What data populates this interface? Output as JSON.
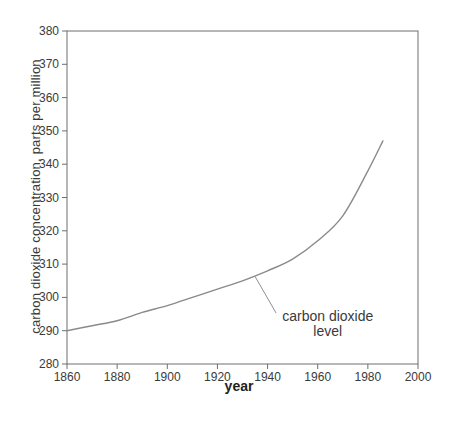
{
  "figure": {
    "background": "#ffffff",
    "axis_color": "#6e6e6e",
    "text_color": "#3a3a3a"
  },
  "chart_data": {
    "type": "line",
    "title": "",
    "xlabel": "year",
    "ylabel": "carbon dioxide concentration, parts per million",
    "xlim": [
      1860,
      2000
    ],
    "ylim": [
      280,
      380
    ],
    "x_ticks": [
      1860,
      1880,
      1900,
      1920,
      1940,
      1960,
      1980,
      2000
    ],
    "y_ticks": [
      280,
      290,
      300,
      310,
      320,
      330,
      340,
      350,
      360,
      370,
      380
    ],
    "grid": false,
    "legend_position": "none",
    "series": [
      {
        "name": "carbon dioxide level",
        "color": "#8a8a8a",
        "points": [
          [
            1860,
            290.0
          ],
          [
            1870,
            291.5
          ],
          [
            1880,
            293.0
          ],
          [
            1890,
            295.5
          ],
          [
            1900,
            297.5
          ],
          [
            1910,
            300.0
          ],
          [
            1920,
            302.5
          ],
          [
            1930,
            305.0
          ],
          [
            1940,
            308.0
          ],
          [
            1950,
            311.5
          ],
          [
            1960,
            317.0
          ],
          [
            1970,
            324.5
          ],
          [
            1980,
            338.0
          ],
          [
            1986,
            347.0
          ]
        ]
      }
    ],
    "annotation": {
      "lines": [
        "carbon dioxide",
        "level"
      ],
      "pointer_xy": [
        1935,
        306.3
      ],
      "elbow_xy": [
        1943.4,
        295.3
      ],
      "text_center_xy": [
        1964,
        294.2
      ],
      "leader_color": "#8f8f8f"
    }
  }
}
